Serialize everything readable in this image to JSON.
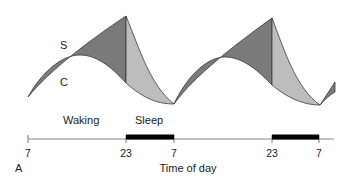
{
  "diagram": {
    "panel_label": "A",
    "curve_labels": {
      "s": "S",
      "c": "C"
    },
    "state_labels": {
      "waking": "Waking",
      "sleep": "Sleep"
    },
    "axis": {
      "xlabel": "Time of day",
      "ticks": [
        "7",
        "23",
        "7",
        "23",
        "7"
      ]
    },
    "colors": {
      "waking_fill": "#7a7a7a",
      "sleep_fill": "#bdbdbd",
      "sleep_bar": "#000000",
      "axis": "#888888",
      "outline": "#3a3a3a"
    }
  }
}
